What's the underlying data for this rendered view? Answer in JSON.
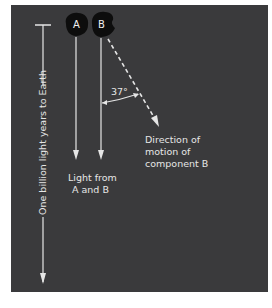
{
  "diagram": {
    "components": [
      {
        "id": "A",
        "label": "A"
      },
      {
        "id": "B",
        "label": "B"
      }
    ],
    "angle_label": "37°",
    "motion_label": [
      "Direction of",
      "motion of",
      "component B"
    ],
    "light_label": [
      "Light from",
      "A and B"
    ],
    "distance_label": "One billion light years to Earth",
    "colors": {
      "background": "#3a3a3c",
      "lines": "#e6e6e6",
      "blobs": "#0d0d0d",
      "page": "#ffffff"
    }
  }
}
